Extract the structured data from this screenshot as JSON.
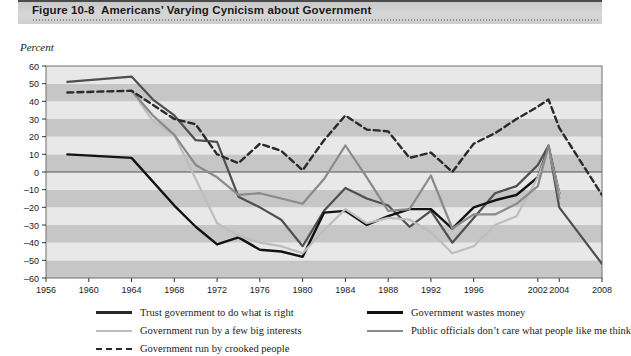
{
  "figure": {
    "number": "Figure 10-8",
    "title": "Americans’ Varying Cynicism about Government",
    "axis_note": "Percent"
  },
  "chart_data": {
    "type": "line",
    "title": "Americans’ Varying Cynicism about Government",
    "xlabel": "",
    "ylabel": "Percent",
    "ylim": [
      -60,
      60
    ],
    "ytick_step": 10,
    "yticks": [
      60,
      50,
      40,
      30,
      20,
      10,
      0,
      -10,
      -20,
      -30,
      -40,
      -50,
      -60
    ],
    "xlim": [
      1956,
      2008
    ],
    "xticks": [
      1956,
      1960,
      1964,
      1968,
      1972,
      1976,
      1980,
      1984,
      1988,
      1992,
      1996,
      2002,
      2004,
      2008
    ],
    "xtick_labels": [
      "1956",
      "1960",
      "1964",
      "1968",
      "1972",
      "1976",
      "1980",
      "1984",
      "1988",
      "1992",
      "1996",
      "2002",
      "2004",
      "2008"
    ],
    "grid": "horizontal-banded",
    "legend_position": "below",
    "series": [
      {
        "name": "Trust government to do what is right",
        "color": "#4f4f4f",
        "style": "solid",
        "width": 2.2,
        "x": [
          1958,
          1964,
          1966,
          1968,
          1970,
          1972,
          1974,
          1976,
          1978,
          1980,
          1982,
          1984,
          1986,
          1988,
          1990,
          1992,
          1994,
          1996,
          1998,
          2000,
          2002,
          2003,
          2004,
          2008
        ],
        "values": [
          51,
          54,
          41,
          32,
          18,
          17,
          -14,
          -20,
          -27,
          -42,
          -22,
          -9,
          -15,
          -19,
          -31,
          -22,
          -40,
          -26,
          -12,
          -8,
          4,
          15,
          -20,
          -52
        ]
      },
      {
        "name": "Government wastes money",
        "color": "#121212",
        "style": "solid",
        "width": 2.4,
        "x": [
          1958,
          1964,
          1968,
          1970,
          1972,
          1974,
          1976,
          1978,
          1980,
          1982,
          1984,
          1986,
          1988,
          1990,
          1992,
          1994,
          1996,
          1998,
          2000,
          2002,
          2003,
          2004
        ],
        "values": [
          10,
          8,
          -19,
          -31,
          -41,
          -37,
          -44,
          -45,
          -48,
          -23,
          -22,
          -30,
          -25,
          -21,
          -21,
          -32,
          -20,
          -16,
          -13,
          -3,
          14,
          -12
        ]
      },
      {
        "name": "Government run by a few big interests",
        "color": "#bdbdbd",
        "style": "solid",
        "width": 2.2,
        "x": [
          1964,
          1966,
          1968,
          1970,
          1972,
          1974,
          1976,
          1978,
          1980,
          1982,
          1984,
          1986,
          1988,
          1990,
          1992,
          1994,
          1996,
          1998,
          2000,
          2002,
          2003,
          2004
        ],
        "values": [
          46,
          29,
          21,
          -4,
          -29,
          -36,
          -40,
          -42,
          -46,
          -33,
          -21,
          -29,
          -26,
          -27,
          -34,
          -46,
          -42,
          -30,
          -25,
          -3,
          13,
          -12
        ]
      },
      {
        "name": "Public officials don’t care what people like me think",
        "color": "#8a8a8a",
        "style": "solid",
        "width": 2.2,
        "x": [
          1964,
          1966,
          1968,
          1970,
          1972,
          1974,
          1976,
          1978,
          1980,
          1982,
          1984,
          1986,
          1988,
          1990,
          1992,
          1994,
          1996,
          1998,
          2000,
          2002,
          2003,
          2004
        ],
        "values": [
          46,
          32,
          21,
          4,
          -3,
          -13,
          -12,
          -15,
          -18,
          -4,
          15,
          -3,
          -22,
          -21,
          -2,
          -32,
          -24,
          -24,
          -18,
          -8,
          15,
          -15
        ]
      },
      {
        "name": "Government run by crooked people",
        "color": "#2a2a2a",
        "style": "dashed",
        "width": 2.4,
        "x": [
          1958,
          1964,
          1968,
          1970,
          1972,
          1974,
          1976,
          1978,
          1980,
          1982,
          1984,
          1986,
          1988,
          1990,
          1992,
          1994,
          1996,
          1998,
          2000,
          2002,
          2003,
          2004,
          2008
        ],
        "values": [
          45,
          46,
          30,
          27,
          10,
          5,
          16,
          12,
          1,
          18,
          32,
          24,
          23,
          8,
          11,
          0,
          16,
          22,
          30,
          37,
          41,
          25,
          -13
        ]
      }
    ]
  },
  "legend": {
    "left_items": [
      {
        "label": "Trust government to do what is right",
        "color": "#2a2a2a",
        "style": "solid-thick"
      },
      {
        "label": "Government run by a few big interests",
        "color": "#bdbdbd",
        "style": "solid"
      },
      {
        "label": "Government run by crooked people",
        "color": "#2a2a2a",
        "style": "dashed"
      }
    ],
    "right_items": [
      {
        "label": "Government wastes money",
        "color": "#121212",
        "style": "solid-thick"
      },
      {
        "label": "Public officials don’t care what people like me think",
        "color": "#8a8a8a",
        "style": "solid"
      }
    ]
  }
}
